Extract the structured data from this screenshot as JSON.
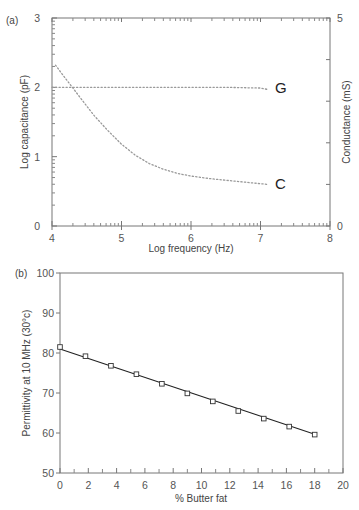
{
  "chart_data": [
    {
      "panel": "(a)",
      "type": "line",
      "title": "",
      "xlabel": "Log frequency (Hz)",
      "ylabel": "Log capacitance (pF)",
      "y2label": "Conductance (mS)",
      "xlim": [
        4,
        8
      ],
      "ylim": [
        0,
        3
      ],
      "y2lim": [
        0,
        5
      ],
      "xticks": [
        "4",
        "5",
        "6",
        "7",
        "8"
      ],
      "yticks": [
        "0",
        "1",
        "2",
        "3"
      ],
      "y2ticks": [
        "0",
        "5"
      ],
      "grid": false,
      "line_style": "dotted",
      "series": [
        {
          "name": "G",
          "axis": "y",
          "x": [
            4.0,
            4.5,
            5.0,
            5.5,
            6.0,
            6.5,
            7.0,
            7.1
          ],
          "values": [
            2.0,
            2.0,
            2.0,
            2.0,
            2.0,
            2.0,
            1.99,
            1.97
          ]
        },
        {
          "name": "C",
          "axis": "y",
          "x": [
            4.05,
            4.2,
            4.4,
            4.6,
            4.8,
            5.0,
            5.2,
            5.4,
            5.6,
            5.8,
            6.0,
            6.3,
            6.6,
            7.0,
            7.1
          ],
          "values": [
            2.32,
            2.12,
            1.86,
            1.6,
            1.38,
            1.18,
            1.02,
            0.9,
            0.82,
            0.76,
            0.72,
            0.68,
            0.65,
            0.61,
            0.6
          ]
        }
      ],
      "annotations": [
        "G",
        "C"
      ]
    },
    {
      "panel": "(b)",
      "type": "scatter",
      "title": "",
      "xlabel": "% Butter fat",
      "ylabel": "Permittivity at 10 MHz (30°c)",
      "xlim": [
        0,
        20
      ],
      "ylim": [
        50,
        100
      ],
      "xticks": [
        "0",
        "2",
        "4",
        "6",
        "8",
        "10",
        "12",
        "14",
        "16",
        "18",
        "20"
      ],
      "yticks": [
        "50",
        "60",
        "70",
        "80",
        "90",
        "100"
      ],
      "grid": false,
      "marker": "square",
      "fit_line": {
        "x": [
          0,
          18
        ],
        "y": [
          81.0,
          59.7
        ]
      },
      "series": [
        {
          "name": "Permittivity",
          "x": [
            0,
            1.8,
            3.6,
            5.4,
            7.2,
            9.0,
            10.8,
            12.6,
            14.4,
            16.2,
            18.0
          ],
          "values": [
            81.5,
            79.2,
            76.8,
            74.7,
            72.3,
            69.9,
            67.9,
            65.5,
            63.6,
            61.6,
            59.6
          ]
        }
      ]
    }
  ],
  "panels": {
    "a": {
      "label": "(a)",
      "xlabel": "Log frequency (Hz)",
      "ylabel": "Log capacitance (pF)",
      "y2label": "Conductance (mS)",
      "curve_g_label": "G",
      "curve_c_label": "C"
    },
    "b": {
      "label": "(b)",
      "xlabel": "% Butter fat",
      "ylabel": "Permittivity at 10 MHz (30°c)"
    }
  }
}
